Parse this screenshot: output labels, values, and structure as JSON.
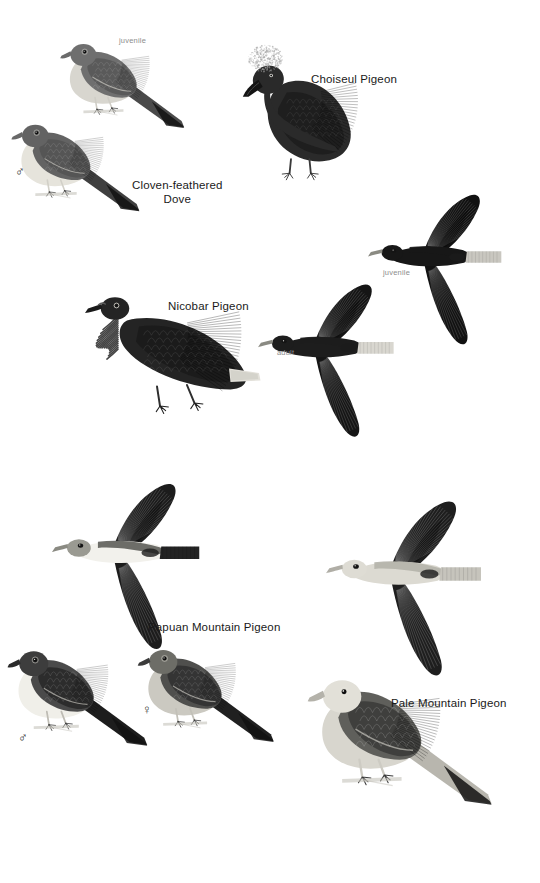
{
  "plate": {
    "width": 540,
    "height": 883,
    "background": "#ffffff",
    "label_color": "#1a1a1a",
    "age_label_color": "#8d8d8d"
  },
  "species_labels": [
    {
      "key": "cloven_feathered_dove",
      "text": "Cloven-feathered\nDove",
      "x": 132,
      "y": 178
    },
    {
      "key": "choiseul_pigeon",
      "text": "Choiseul Pigeon",
      "x": 311,
      "y": 72
    },
    {
      "key": "nicobar_pigeon",
      "text": "Nicobar Pigeon",
      "x": 168,
      "y": 299
    },
    {
      "key": "papuan_mountain_pigeon",
      "text": "Papuan Mountain Pigeon",
      "x": 148,
      "y": 620
    },
    {
      "key": "pale_mountain_pigeon",
      "text": "Pale Mountain Pigeon",
      "x": 391,
      "y": 696
    }
  ],
  "age_labels": [
    {
      "key": "cloven_juvenile",
      "text": "juvenile",
      "x": 119,
      "y": 36
    },
    {
      "key": "nicobar_juvenile",
      "text": "juvenile",
      "x": 383,
      "y": 268
    },
    {
      "key": "nicobar_adult",
      "text": "adult",
      "x": 277,
      "y": 348
    }
  ],
  "sex_labels": [
    {
      "key": "cloven_male",
      "symbol": "♂",
      "x": 15,
      "y": 165
    },
    {
      "key": "papuan_male",
      "symbol": "♂",
      "x": 18,
      "y": 731
    },
    {
      "key": "papuan_female",
      "symbol": "♀",
      "x": 142,
      "y": 703
    }
  ],
  "figures": [
    {
      "key": "cloven_feathered_dove_juvenile",
      "name": "cloven-feathered-dove-juvenile",
      "species": "Cloven-feathered Dove",
      "age": "juvenile",
      "pose": "perched",
      "x": 55,
      "y": 14,
      "width": 155,
      "height": 175,
      "plumage": {
        "body": "#6f6f6f",
        "wing": "#5a5a5a",
        "belly": "#d8d6cf",
        "tail": "#4a4a4a",
        "bill": "#6a6a6a",
        "feet": "#cfcdc6"
      }
    },
    {
      "key": "cloven_feathered_dove_male",
      "name": "cloven-feathered-dove-male",
      "species": "Cloven-feathered Dove",
      "age": "adult",
      "sex": "male",
      "pose": "perched",
      "x": 6,
      "y": 104,
      "width": 160,
      "height": 160,
      "plumage": {
        "body": "#636363",
        "wing": "#555555",
        "belly": "#e6e4dc",
        "tail": "#3f3f3f",
        "bill": "#686868",
        "feet": "#d2d0c8"
      }
    },
    {
      "key": "choiseul_pigeon",
      "name": "choiseul-pigeon-perched",
      "species": "Choiseul Pigeon",
      "pose": "perched",
      "x": 240,
      "y": 18,
      "width": 170,
      "height": 200,
      "plumage": {
        "body": "#2a2a2a",
        "wing": "#1e1e1e",
        "crest": "#a8a8a8",
        "bill": "#141414",
        "feet": "#3a3a3a"
      }
    },
    {
      "key": "nicobar_pigeon_perched",
      "name": "nicobar-pigeon-perched",
      "species": "Nicobar Pigeon",
      "pose": "perched",
      "x": 52,
      "y": 286,
      "width": 240,
      "height": 165,
      "plumage": {
        "body": "#242424",
        "wing": "#1b1b1b",
        "hackles": "#3b3b3b",
        "tail_tip": "#e3e1da",
        "bill": "#1a1a1a",
        "feet": "#2e2e2e"
      }
    },
    {
      "key": "nicobar_pigeon_adult_flight",
      "name": "nicobar-pigeon-adult-flight",
      "species": "Nicobar Pigeon",
      "age": "adult",
      "pose": "flight",
      "x": 258,
      "y": 236,
      "width": 175,
      "height": 250,
      "plumage": {
        "body": "#1d1d1d",
        "wing": "#151515",
        "tail_tip": "#d9d7d0"
      }
    },
    {
      "key": "nicobar_pigeon_juvenile_flight",
      "name": "nicobar-pigeon-juvenile-flight",
      "species": "Nicobar Pigeon",
      "age": "juvenile",
      "pose": "flight",
      "x": 368,
      "y": 150,
      "width": 172,
      "height": 240,
      "plumage": {
        "body": "#171717",
        "wing": "#111111",
        "tail_tip": "#c9c7c0"
      }
    },
    {
      "key": "papuan_mountain_pigeon_flight",
      "name": "papuan-mountain-pigeon-flight",
      "species": "Papuan Mountain Pigeon",
      "pose": "flight",
      "x": 52,
      "y": 462,
      "width": 190,
      "height": 210,
      "plumage": {
        "head": "#9a9a92",
        "belly": "#f2f1ec",
        "back": "#5e5e5a",
        "wing": "#1c1c1c",
        "tail": "#232323",
        "bill": "#8a8a82"
      }
    },
    {
      "key": "pale_mountain_pigeon_flight",
      "name": "pale-mountain-pigeon-flight",
      "species": "Pale Mountain Pigeon",
      "pose": "flight",
      "x": 326,
      "y": 483,
      "width": 200,
      "height": 212,
      "plumage": {
        "head": "#dedcd4",
        "belly": "#dcdad2",
        "back": "#b4b2aa",
        "wing": "#1e1e1e",
        "tail": "#c6c4bc",
        "bill": "#b0aea6"
      }
    },
    {
      "key": "papuan_mountain_pigeon_male",
      "name": "papuan-mountain-pigeon-male",
      "species": "Papuan Mountain Pigeon",
      "sex": "male",
      "pose": "perched",
      "x": 0,
      "y": 636,
      "width": 178,
      "height": 160,
      "plumage": {
        "head": "#3d3d3d",
        "breast": "#f0efe9",
        "back": "#4a4a4a",
        "wing": "#2c2c2c",
        "tail": "#1d1d1d",
        "bill": "#2a2a2a",
        "feet": "#bebcb4"
      }
    },
    {
      "key": "papuan_mountain_pigeon_female",
      "name": "papuan-mountain-pigeon-female",
      "species": "Papuan Mountain Pigeon",
      "sex": "female",
      "pose": "perched",
      "x": 132,
      "y": 634,
      "width": 170,
      "height": 158,
      "plumage": {
        "head": "#6d6d67",
        "breast": "#cbc9c1",
        "back": "#4f4f4d",
        "wing": "#343434",
        "tail": "#202020",
        "bill": "#3a3a3a",
        "feet": "#c2c0b8"
      }
    },
    {
      "key": "pale_mountain_pigeon_perched",
      "name": "pale-mountain-pigeon-perched",
      "species": "Pale Mountain Pigeon",
      "pose": "perched",
      "x": 300,
      "y": 658,
      "width": 230,
      "height": 215,
      "plumage": {
        "head": "#e2e0d8",
        "breast": "#d8d6ce",
        "back": "#5f5f5b",
        "wing": "#3f3f3d",
        "tail": "#b8b6ae",
        "bill": "#b4b2aa",
        "feet": "#cdcbc3"
      }
    }
  ]
}
